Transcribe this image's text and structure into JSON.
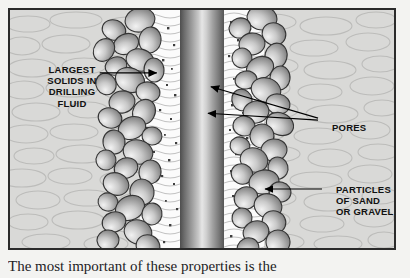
{
  "figure": {
    "frame_border_color": "#2b2b2b",
    "background_color": "#f3f3f1"
  },
  "regions": {
    "formation_label": "rock formation matrix",
    "fluid_label": "drilling fluid invaded zone",
    "borehole_label": "borehole / drill pipe column",
    "particle_layer_label": "sand and gravel particle bridge"
  },
  "labels": {
    "largest_solids": {
      "lines": [
        "LARGEST",
        "SOLIDS IN",
        "DRILLING",
        "FLUID"
      ],
      "text": "LARGEST\nSOLIDS IN\nDRILLING\nFLUID",
      "align": "center"
    },
    "pores": {
      "lines": [
        "PORES"
      ],
      "text": "PORES",
      "align": "left"
    },
    "particles_of_sand": {
      "lines": [
        "PARTICLES",
        "OF SAND",
        "OR GRAVEL"
      ],
      "text": "PARTICLES\nOF SAND\nOR GRAVEL",
      "align": "left"
    }
  },
  "caption": {
    "text": "The most important of these properties is the"
  },
  "colors": {
    "rock_fill": "#d9d9d7",
    "rock_outline": "#b9b9b7",
    "fluid_fill": "#fbfbfb",
    "speck": "#4a4a4a",
    "particle_light": "#f0f0f0",
    "particle_mid": "#b8b8b8",
    "particle_dark": "#7d7d7d",
    "particle_outline": "#3a3a3a",
    "text": "#111111",
    "leader": "#000000"
  }
}
